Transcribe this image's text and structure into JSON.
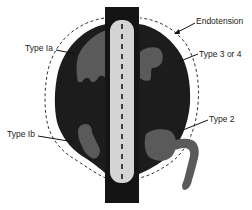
{
  "figure": {
    "colors": {
      "sac": "#1c1c1c",
      "vessel": "#141414",
      "stent": "#d4d4d4",
      "leak": "#5a5a5a",
      "outline_dashed": "#333333",
      "leader": "#111111"
    }
  },
  "labels": {
    "endotension": "Endotension",
    "type_ia": "Type Ia",
    "type_3_or_4": "Type 3 or 4",
    "type_ib": "Type Ib",
    "type_2": "Type 2"
  }
}
